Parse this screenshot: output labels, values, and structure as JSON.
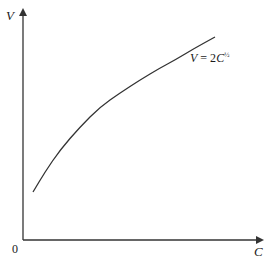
{
  "chart_data": {
    "type": "line",
    "title": "",
    "xlabel": "C",
    "ylabel": "V",
    "origin_label": "0",
    "series": [
      {
        "name": "V = 2C^1/2",
        "equation": "V = 2C^(1/2)",
        "pixel_path": [
          [
            33,
            192
          ],
          [
            45,
            172
          ],
          [
            60,
            150
          ],
          [
            80,
            127
          ],
          [
            100,
            107
          ],
          [
            120,
            93
          ],
          [
            140,
            80
          ],
          [
            160,
            68
          ],
          [
            175,
            60
          ],
          [
            195,
            48
          ],
          [
            215,
            37
          ]
        ]
      }
    ],
    "grid": false,
    "legend": "inline annotation near curve end",
    "ticks": "none"
  },
  "labels": {
    "y_axis": "V",
    "x_axis": "C",
    "origin": "0",
    "curve_V": "V",
    "curve_eq": " = 2",
    "curve_C": "C",
    "curve_exp": "½"
  },
  "colors": {
    "axis": "#333333",
    "curve": "#333333",
    "text": "#1a1a1a"
  }
}
